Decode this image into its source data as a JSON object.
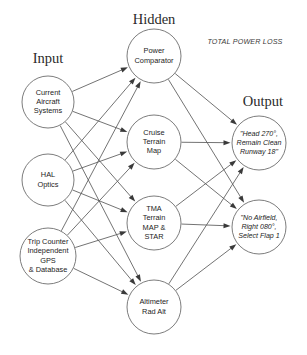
{
  "diagram": {
    "background_color": "#ffffff",
    "node_stroke_color": "#6d6d6d",
    "edge_color": "#5a5a5a",
    "text_color": "#1c1c1c"
  },
  "headings": [
    {
      "id": "heading-input",
      "label": "Input",
      "x": 48,
      "y": 60
    },
    {
      "id": "heading-hidden",
      "label": "Hidden",
      "x": 154,
      "y": 21
    },
    {
      "id": "heading-output",
      "label": "Output",
      "x": 263,
      "y": 103
    }
  ],
  "annotations": [
    {
      "id": "total-power-loss",
      "label": "TOTAL POWER LOSS",
      "x": 245,
      "y": 42
    }
  ],
  "layers": {
    "input": {
      "name": "Input",
      "nodes": [
        {
          "id": "current-aircraft-systems",
          "lines": [
            "Current",
            "Aircraft",
            "Systems"
          ],
          "cx": 48,
          "cy": 102,
          "r": 26
        },
        {
          "id": "hal-optics",
          "lines": [
            "HAL",
            "Optics"
          ],
          "cx": 48,
          "cy": 180,
          "r": 26
        },
        {
          "id": "trip-counter-gps",
          "lines": [
            "Trip Counter",
            "Independent",
            "GPS",
            "& Database"
          ],
          "cx": 48,
          "cy": 256,
          "r": 28
        }
      ]
    },
    "hidden": {
      "name": "Hidden",
      "nodes": [
        {
          "id": "power-comparator",
          "lines": [
            "Power",
            "Comparator"
          ],
          "cx": 154,
          "cy": 56,
          "r": 27
        },
        {
          "id": "cruise-terrain-map",
          "lines": [
            "Cruise",
            "Terrain",
            "Map"
          ],
          "cx": 154,
          "cy": 142,
          "r": 27
        },
        {
          "id": "tma-terrain-map-star",
          "lines": [
            "TMA",
            "Terrain",
            "MAP &",
            "STAR"
          ],
          "cx": 154,
          "cy": 223,
          "r": 27
        },
        {
          "id": "altimeter-rad-alt",
          "lines": [
            "Altimeter",
            "Rad Alt"
          ],
          "cx": 154,
          "cy": 307,
          "r": 27
        }
      ]
    },
    "output": {
      "name": "Output",
      "nodes": [
        {
          "id": "head-270-remain-clean",
          "lines": [
            "\"Head 270°,",
            "Remain Clean",
            "Runway 18\""
          ],
          "italic": true,
          "cx": 259,
          "cy": 143,
          "r": 27
        },
        {
          "id": "no-airfield-right-080",
          "lines": [
            "\"No Airfield,",
            "Right 080°,",
            "Select Flap 1"
          ],
          "italic": true,
          "cx": 259,
          "cy": 227,
          "r": 27
        }
      ]
    }
  },
  "edges": [
    {
      "id": "e1",
      "from": "current-aircraft-systems",
      "to": "power-comparator"
    },
    {
      "id": "e2",
      "from": "current-aircraft-systems",
      "to": "cruise-terrain-map"
    },
    {
      "id": "e3",
      "from": "current-aircraft-systems",
      "to": "tma-terrain-map-star"
    },
    {
      "id": "e4",
      "from": "current-aircraft-systems",
      "to": "altimeter-rad-alt"
    },
    {
      "id": "e5",
      "from": "hal-optics",
      "to": "power-comparator"
    },
    {
      "id": "e6",
      "from": "hal-optics",
      "to": "cruise-terrain-map"
    },
    {
      "id": "e7",
      "from": "hal-optics",
      "to": "tma-terrain-map-star"
    },
    {
      "id": "e8",
      "from": "hal-optics",
      "to": "altimeter-rad-alt"
    },
    {
      "id": "e9",
      "from": "trip-counter-gps",
      "to": "power-comparator"
    },
    {
      "id": "e10",
      "from": "trip-counter-gps",
      "to": "cruise-terrain-map"
    },
    {
      "id": "e11",
      "from": "trip-counter-gps",
      "to": "tma-terrain-map-star"
    },
    {
      "id": "e12",
      "from": "trip-counter-gps",
      "to": "altimeter-rad-alt"
    },
    {
      "id": "e13",
      "from": "power-comparator",
      "to": "head-270-remain-clean"
    },
    {
      "id": "e14",
      "from": "power-comparator",
      "to": "no-airfield-right-080"
    },
    {
      "id": "e15",
      "from": "cruise-terrain-map",
      "to": "head-270-remain-clean"
    },
    {
      "id": "e16",
      "from": "cruise-terrain-map",
      "to": "no-airfield-right-080"
    },
    {
      "id": "e17",
      "from": "tma-terrain-map-star",
      "to": "head-270-remain-clean"
    },
    {
      "id": "e18",
      "from": "tma-terrain-map-star",
      "to": "no-airfield-right-080"
    },
    {
      "id": "e19",
      "from": "altimeter-rad-alt",
      "to": "head-270-remain-clean"
    },
    {
      "id": "e20",
      "from": "altimeter-rad-alt",
      "to": "no-airfield-right-080"
    }
  ]
}
